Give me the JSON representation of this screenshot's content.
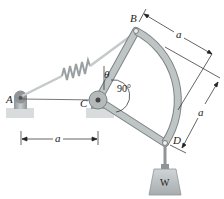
{
  "diagram": {
    "type": "mechanism",
    "labels": {
      "A": "A",
      "B": "B",
      "C": "C",
      "D": "D",
      "theta": "θ",
      "right_angle": "90°",
      "weight": "W",
      "dim_AC": "a",
      "dim_B": "a",
      "dim_D": "a"
    },
    "components": [
      "pin-support-A",
      "pivot-C",
      "bell-crank-BCD",
      "spring-AB",
      "cable-AC",
      "weight-W"
    ],
    "colors": {
      "member": "#b9bfc0",
      "member_edge": "#7d8486",
      "support": "#9aa0a2",
      "ground": "#d9dcdc",
      "spring": "#c9cdce",
      "line": "#222222"
    }
  }
}
